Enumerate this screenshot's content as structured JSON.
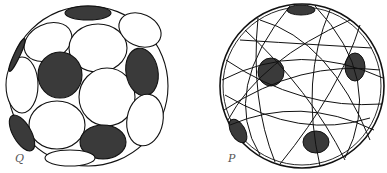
{
  "figures": [
    {
      "id": "left-sphere",
      "label": "Q",
      "description": "Sphere packed with circular caps (soccer-ball pattern), some caps shaded dark"
    },
    {
      "id": "right-sphere",
      "label": "P",
      "description": "Sphere covered with great-circle arcs, five dark pentagonal caps"
    }
  ],
  "colors": {
    "stroke": "#111111",
    "fill_dark": "#3a3a3a",
    "background": "#ffffff"
  }
}
